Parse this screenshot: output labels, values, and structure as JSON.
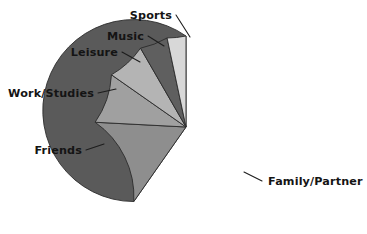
{
  "chart_data": {
    "type": "pie",
    "title": "",
    "subtitle": "",
    "xlabel": "",
    "ylabel": "",
    "legend_position": "none",
    "grid": false,
    "labels_outside": true,
    "start_angle_deg": 0,
    "direction": "counterclockwise",
    "categories": [
      "Family/Partner",
      "Friends",
      "Work/Studies",
      "Leisure",
      "Music",
      "Sports"
    ],
    "values": [
      59.7,
      16.1,
      8.9,
      6.9,
      5.0,
      3.4
    ],
    "value_unit": "percent",
    "slices": [
      {
        "label": "Family/Partner",
        "value": 59.7,
        "color": "#5a5a5a",
        "start_deg": 0,
        "end_deg": 215,
        "label_x": 268,
        "label_y": 185,
        "label_anchor": "start",
        "leader": "M 244 172 L 262 181"
      },
      {
        "label": "Friends",
        "value": 16.1,
        "color": "#8e8e8e",
        "start_deg": 215,
        "end_deg": 273,
        "label_x": 82,
        "label_y": 154,
        "label_anchor": "end",
        "leader": "M 86 150 L 104 144"
      },
      {
        "label": "Work/Studies",
        "value": 8.9,
        "color": "#a0a0a0",
        "start_deg": 273,
        "end_deg": 305,
        "label_x": 94,
        "label_y": 97,
        "label_anchor": "end",
        "leader": "M 98 93 L 116 89"
      },
      {
        "label": "Leisure",
        "value": 6.9,
        "color": "#b4b4b4",
        "start_deg": 305,
        "end_deg": 330,
        "label_x": 118,
        "label_y": 56,
        "label_anchor": "end",
        "leader": "M 122 52 L 140 62"
      },
      {
        "label": "Music",
        "value": 5.0,
        "color": "#5f5f5f",
        "start_deg": 330,
        "end_deg": 348,
        "label_x": 144,
        "label_y": 40,
        "label_anchor": "end",
        "leader": "M 148 36 L 164 46"
      },
      {
        "label": "Sports",
        "value": 3.4,
        "color": "#d8d8d8",
        "start_deg": 348,
        "end_deg": 360,
        "label_x": 172,
        "label_y": 19,
        "label_anchor": "end",
        "leader": "M 176 15 L 190 37"
      }
    ],
    "geometry": {
      "center_x": 186,
      "center_y": 127,
      "radius": 91
    },
    "style": {
      "background": "#ffffff",
      "slice_border": "#2b2b2b",
      "label_color": "#141414",
      "leader_color": "#1d1d1d"
    }
  }
}
